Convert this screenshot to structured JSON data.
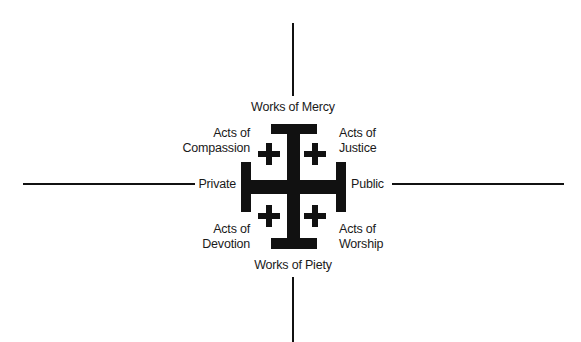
{
  "diagram": {
    "type": "quadrant-cross",
    "axes": {
      "vertical_top_label": "Works of Mercy",
      "vertical_bottom_label": "Works of Piety",
      "horizontal_left_label": "Private",
      "horizontal_right_label": "Public"
    },
    "quadrants": {
      "top_left": {
        "line1": "Acts of",
        "line2": "Compassion"
      },
      "top_right": {
        "line1": "Acts of",
        "line2": "Justice"
      },
      "bottom_left": {
        "line1": "Acts of",
        "line2": "Devotion"
      },
      "bottom_right": {
        "line1": "Acts of",
        "line2": "Worship"
      }
    },
    "center_symbol": "jerusalem-cross-icon",
    "colors": {
      "ink": "#111111",
      "background": "#ffffff"
    }
  }
}
